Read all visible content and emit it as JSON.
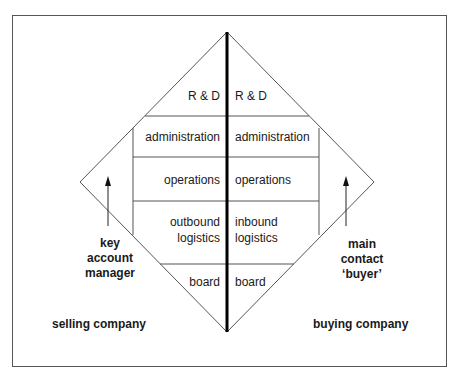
{
  "diagram": {
    "type": "diamond relationship model",
    "left_side": {
      "functions": [
        "R & D",
        "administration",
        "operations",
        "outbound logistics",
        "board"
      ],
      "role_label": "key account manager",
      "role_lines": [
        "key",
        "account",
        "manager"
      ],
      "company_label": "selling company"
    },
    "right_side": {
      "functions": [
        "R & D",
        "administration",
        "operations",
        "inbound logistics",
        "board"
      ],
      "role_label": "main contact ‘buyer’",
      "role_lines": [
        "main",
        "contact",
        "‘buyer’"
      ],
      "company_label": "buying company"
    },
    "labels": {
      "left_rd": "R & D",
      "right_rd": "R & D",
      "left_admin": "administration",
      "right_admin": "administration",
      "left_ops": "operations",
      "right_ops": "operations",
      "left_log1": "outbound",
      "left_log2": "logistics",
      "right_log1": "inbound",
      "right_log2": "logistics",
      "left_board": "board",
      "right_board": "board",
      "left_role1": "key",
      "left_role2": "account",
      "left_role3": "manager",
      "right_role1": "main",
      "right_role2": "contact",
      "right_role3": "‘buyer’",
      "left_company": "selling company",
      "right_company": "buying company"
    },
    "colors": {
      "line": "#555555",
      "divider": "#000000",
      "text": "#1a1a1a"
    }
  }
}
